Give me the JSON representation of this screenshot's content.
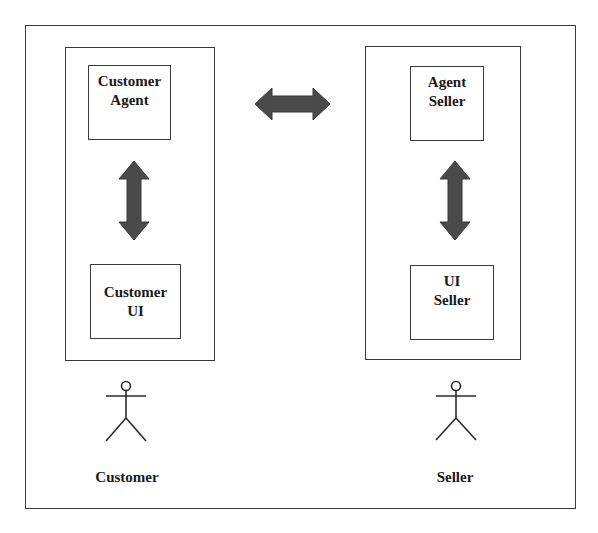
{
  "diagram": {
    "type": "agent-interaction",
    "colors": {
      "line": "#3a3a3a",
      "arrow_fill": "#4a4a4a",
      "text": "#1a1a1a",
      "background": "#ffffff"
    },
    "left_panel": {
      "top_box": {
        "line1": "Customer",
        "line2": "Agent"
      },
      "bottom_box": {
        "line1": "Customer",
        "line2": "UI"
      },
      "actor": {
        "label": "Customer",
        "icon": "stick-figure-icon"
      }
    },
    "right_panel": {
      "top_box": {
        "line1": "Agent",
        "line2": "Seller"
      },
      "bottom_box": {
        "line1": "UI",
        "line2": "Seller"
      },
      "actor": {
        "label": "Seller",
        "icon": "stick-figure-icon"
      }
    },
    "connections": [
      {
        "from": "Customer Agent",
        "to": "Agent Seller",
        "direction": "bidirectional",
        "icon": "double-arrow-horizontal-icon"
      },
      {
        "from": "Customer Agent",
        "to": "Customer UI",
        "direction": "bidirectional",
        "icon": "double-arrow-vertical-icon"
      },
      {
        "from": "Agent Seller",
        "to": "UI Seller",
        "direction": "bidirectional",
        "icon": "double-arrow-vertical-icon"
      }
    ]
  }
}
